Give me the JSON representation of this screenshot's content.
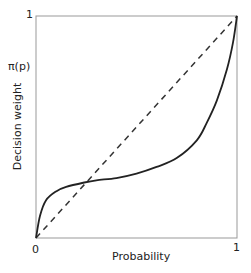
{
  "chart_data": {
    "type": "line",
    "title": "",
    "xlabel": "Probability",
    "ylabel": "Decision weight",
    "y_annotation": "π(p)",
    "x_ticks": [
      "0",
      "1"
    ],
    "y_ticks": [
      "1"
    ],
    "xlim": [
      0,
      1
    ],
    "ylim": [
      0,
      1
    ],
    "grid": false,
    "legend": "none",
    "series": [
      {
        "name": "Decision weight π(p)",
        "style": "solid",
        "x": [
          0,
          0.02,
          0.05,
          0.1,
          0.15,
          0.24,
          0.3,
          0.4,
          0.5,
          0.6,
          0.7,
          0.8,
          0.85,
          0.9,
          0.95,
          0.98,
          1.0
        ],
        "y": [
          0,
          0.1,
          0.17,
          0.21,
          0.23,
          0.25,
          0.26,
          0.27,
          0.29,
          0.32,
          0.36,
          0.44,
          0.52,
          0.62,
          0.76,
          0.88,
          1.0
        ]
      },
      {
        "name": "Identity (π(p) = p)",
        "style": "dashed",
        "x": [
          0,
          1
        ],
        "y": [
          0,
          1
        ]
      }
    ]
  },
  "labels": {
    "y_top_tick": "1",
    "y_annotation": "π(p)",
    "ylabel": "Decision weight",
    "x_zero_tick": "0",
    "x_one_tick": "1",
    "xlabel": "Probability"
  }
}
